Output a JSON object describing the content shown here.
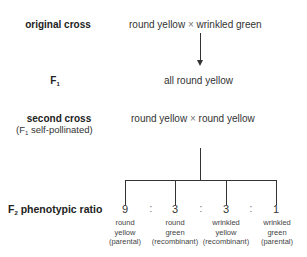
{
  "rows": {
    "original_cross": {
      "label": "original cross",
      "parent1": "round yellow",
      "cross_symbol": "×",
      "parent2": "wrinkled green"
    },
    "f1": {
      "label_main": "F",
      "label_sub": "1",
      "result": "all round yellow"
    },
    "second_cross": {
      "label": "second cross",
      "sublabel_pre": "(F",
      "sublabel_sub": "1",
      "sublabel_post": " self-pollinated)",
      "parent1": "round yellow",
      "cross_symbol": "×",
      "parent2": "round yellow"
    },
    "f2": {
      "label_main": "F",
      "label_sub": "2",
      "label_post": " phenotypic ratio",
      "separator": ":",
      "outcomes": [
        {
          "ratio": "9",
          "line1": "round",
          "line2": "yellow",
          "line3": "(parental)"
        },
        {
          "ratio": "3",
          "line1": "round",
          "line2": "green",
          "line3": "(recombinant)"
        },
        {
          "ratio": "3",
          "line1": "wrinkled",
          "line2": "yellow",
          "line3": "(recombinant)"
        },
        {
          "ratio": "1",
          "line1": "wrinkled",
          "line2": "green",
          "line3": "(parental)"
        }
      ]
    }
  },
  "colors": {
    "text": "#222222",
    "lines": "#333333",
    "background": "#ffffff"
  }
}
